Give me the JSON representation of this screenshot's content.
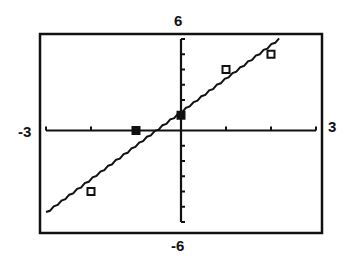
{
  "chart_data": {
    "type": "scatter",
    "title": "",
    "xlabel": "",
    "ylabel": "",
    "xlim": [
      -3,
      3
    ],
    "ylim": [
      -6,
      6
    ],
    "x_tick_step": 1,
    "y_tick_step": 1,
    "grid": false,
    "axis_labels": {
      "xmin": "-3",
      "xmax": "3",
      "ymin": "-6",
      "ymax": "6"
    },
    "series": [
      {
        "name": "data",
        "marker": "square",
        "points": [
          {
            "x": -2,
            "y": -4,
            "filled": false
          },
          {
            "x": -1,
            "y": 0,
            "filled": true
          },
          {
            "x": 0,
            "y": 1,
            "filled": true
          },
          {
            "x": 1,
            "y": 4,
            "filled": false
          },
          {
            "x": 2,
            "y": 5,
            "filled": false
          }
        ]
      },
      {
        "name": "regression line",
        "type": "line",
        "slope": 2.2,
        "intercept": 1.2,
        "x_range": [
          -3,
          2.18
        ]
      }
    ],
    "colors": {
      "ink": "#111111",
      "background": "#ffffff"
    }
  }
}
